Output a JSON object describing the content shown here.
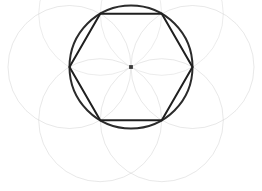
{
  "figure": {
    "title": "Hexagon inscribed in circle with surrounding construction circles",
    "canvas": {
      "width": 262,
      "height": 191,
      "background": "#ffffff"
    },
    "colors": {
      "background": "#ffffff",
      "primary_stroke": "#2b2b2b",
      "hexagon_stroke": "#1f1f1f",
      "construction_stroke": "#c9c9c9",
      "construction_stroke_faint": "#d8d8d8",
      "center_dot": "#3a3a3a"
    },
    "strokes": {
      "primary_circle_width": 2.0,
      "hexagon_width": 2.0,
      "construction_width": 0.7
    },
    "center_point": {
      "label": "center",
      "cx": 131,
      "cy": 67,
      "r": 1.9
    },
    "primary_circle": {
      "label": "circumscribed-circle",
      "cx": 131,
      "cy": 67,
      "r": 61.5
    },
    "hexagon": {
      "label": "regular-hexagon",
      "sides": 6,
      "circumradius": 61.5,
      "rotation_deg": 0,
      "points": "192.5,67 161.8,120.2 100.2,120.2 69.5,67 100.2,13.8 161.8,13.8"
    },
    "construction_circles": [
      {
        "label": "circle-left",
        "cx": 69.5,
        "cy": 67,
        "r": 61.5,
        "opacity": 0.62
      },
      {
        "label": "circle-right",
        "cx": 192.5,
        "cy": 67,
        "r": 61.5,
        "opacity": 0.62
      },
      {
        "label": "circle-upper-left",
        "cx": 100.2,
        "cy": 13.8,
        "r": 61.5,
        "opacity": 0.5
      },
      {
        "label": "circle-upper-right",
        "cx": 161.8,
        "cy": 13.8,
        "r": 61.5,
        "opacity": 0.5
      },
      {
        "label": "circle-lower-left",
        "cx": 100.2,
        "cy": 120.2,
        "r": 61.5,
        "opacity": 0.62
      },
      {
        "label": "circle-lower-right",
        "cx": 161.8,
        "cy": 120.2,
        "r": 61.5,
        "opacity": 0.62
      }
    ]
  }
}
